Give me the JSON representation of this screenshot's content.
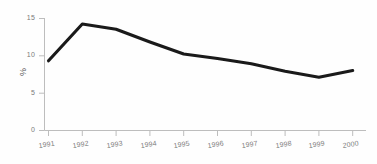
{
  "chart_data": {
    "type": "line",
    "title": "",
    "subtitle": "",
    "xlabel": "",
    "ylabel": "%",
    "categories": [
      "1991",
      "1992",
      "1993",
      "1994",
      "1995",
      "1996",
      "1997",
      "1998",
      "1999",
      "2000"
    ],
    "values": [
      9.3,
      14.2,
      13.5,
      11.8,
      10.2,
      9.6,
      8.9,
      7.9,
      7.1,
      8.0
    ],
    "series": [
      {
        "name": "",
        "values": [
          9.3,
          14.2,
          13.5,
          11.8,
          10.2,
          9.6,
          8.9,
          7.9,
          7.1,
          8.0
        ]
      }
    ],
    "ylim": [
      0,
      15
    ],
    "y_ticks": [
      "0",
      "5",
      "10",
      "15"
    ],
    "y_tick_values": [
      0,
      5,
      10,
      15
    ],
    "grid": false,
    "legend": "none",
    "line_color": "#1a1a1a",
    "axis_color": "#b8b8b8",
    "background_color": "#fefefe"
  },
  "axes": {
    "y_title": "%",
    "y_tick_labels": [
      "15",
      "10",
      "5",
      "0"
    ],
    "x_tick_labels": [
      "1991",
      "1992",
      "1993",
      "1994",
      "1995",
      "1996",
      "1997",
      "1998",
      "1999",
      "2000"
    ]
  }
}
